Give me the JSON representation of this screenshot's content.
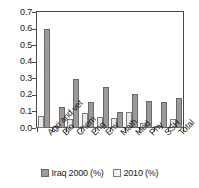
{
  "chart_data": {
    "type": "bar",
    "title": "",
    "xlabel": "",
    "ylabel": "",
    "ylim": [
      0.0,
      0.7
    ],
    "grid": false,
    "legend_position": "bottom",
    "categories": [
      "Agri and vet",
      "Bio",
      "Chem",
      "Eng",
      "Env",
      "Math",
      "Med",
      "Phy",
      "SSH",
      "Total"
    ],
    "y_ticks": [
      "0.0",
      "0.1",
      "0.2",
      "0.3",
      "0.4",
      "0.5",
      "0.6",
      "0.7"
    ],
    "y_tick_values": [
      0.0,
      0.1,
      0.2,
      0.3,
      0.4,
      0.5,
      0.6,
      0.7
    ],
    "series": [
      {
        "name": "2010 (%)",
        "color": "#e9e9e9",
        "draw_order": 1,
        "values": [
          0.07,
          0.015,
          0.055,
          0.09,
          0.065,
          0.06,
          0.095,
          0.03,
          0.015,
          0.055
        ]
      },
      {
        "name": "Iraq 2000 (%)",
        "color": "#9a9a9a",
        "draw_order": 2,
        "values": [
          0.6,
          0.125,
          0.295,
          0.155,
          0.25,
          0.095,
          0.205,
          0.165,
          0.155,
          0.18
        ]
      }
    ]
  },
  "legend": {
    "items": [
      {
        "label": "Iraq 2000 (%)",
        "swatch": "dark"
      },
      {
        "label": "2010 (%)",
        "swatch": "light"
      }
    ]
  }
}
